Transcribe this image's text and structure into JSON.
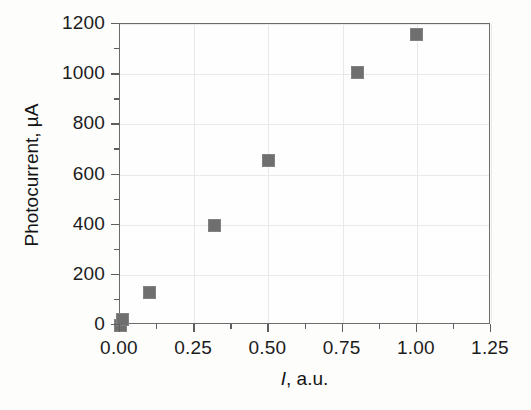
{
  "chart_data": {
    "type": "scatter",
    "title": "",
    "xlabel": "I, a.u.",
    "xlabel_symbol": "I",
    "xlabel_rest": ", a.u.",
    "ylabel": "Photocurrent, µA",
    "xlim": [
      0.0,
      1.25
    ],
    "ylim": [
      0,
      1200
    ],
    "xticks": [
      0.0,
      0.25,
      0.5,
      0.75,
      1.0,
      1.25
    ],
    "xticklabels": [
      "0.00",
      "0.25",
      "0.50",
      "0.75",
      "1.00",
      "1.25"
    ],
    "yticks": [
      0,
      200,
      400,
      600,
      800,
      1000,
      1200
    ],
    "yticklabels": [
      "0",
      "200",
      "400",
      "600",
      "800",
      "1000",
      "1200"
    ],
    "minor_ticks_per_interval": 1,
    "grid": true,
    "grid_color": "#e9e9e6",
    "legend": null,
    "marker": "square",
    "marker_color": "#6f6f6f",
    "axis_color": "#6b6b6b",
    "series": [
      {
        "name": "Photocurrent",
        "points": [
          {
            "x": 0.0,
            "y": 0
          },
          {
            "x": 0.01,
            "y": 20
          },
          {
            "x": 0.1,
            "y": 130
          },
          {
            "x": 0.32,
            "y": 395
          },
          {
            "x": 0.5,
            "y": 655
          },
          {
            "x": 0.8,
            "y": 1005
          },
          {
            "x": 1.0,
            "y": 1160
          }
        ]
      }
    ]
  }
}
